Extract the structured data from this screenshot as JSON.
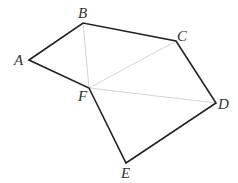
{
  "diagram": {
    "type": "geometry-figure",
    "colors": {
      "main_stroke": "#222222",
      "aux_stroke": "#d4d4d4",
      "label": "#333333",
      "background": "#ffffff"
    },
    "points": {
      "A": {
        "label": "A",
        "x": 29,
        "y": 60
      },
      "B": {
        "label": "B",
        "x": 83,
        "y": 23
      },
      "C": {
        "label": "C",
        "x": 176,
        "y": 41
      },
      "D": {
        "label": "D",
        "x": 216,
        "y": 103
      },
      "E": {
        "label": "E",
        "x": 126,
        "y": 163
      },
      "F": {
        "label": "F",
        "x": 89,
        "y": 88
      }
    },
    "main_edges": [
      [
        "A",
        "B"
      ],
      [
        "B",
        "C"
      ],
      [
        "C",
        "D"
      ],
      [
        "D",
        "E"
      ],
      [
        "E",
        "F"
      ],
      [
        "F",
        "A"
      ]
    ],
    "auxiliary_edges": [
      [
        "B",
        "F"
      ],
      [
        "F",
        "C"
      ],
      [
        "F",
        "D"
      ]
    ]
  }
}
